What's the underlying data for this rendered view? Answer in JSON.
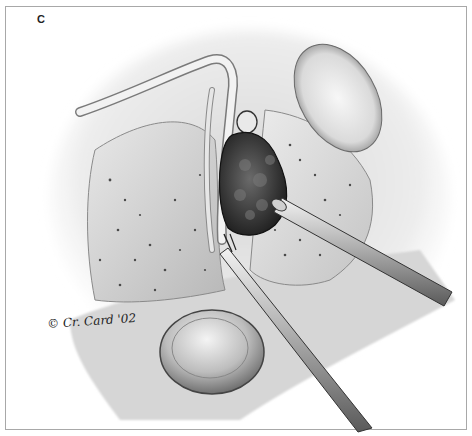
{
  "figure": {
    "panel_label": "C",
    "signature": "© Cr. Card '02"
  },
  "colors": {
    "frame_border": "#a8a8a8",
    "background": "#ffffff",
    "mass": "#3a3a3a",
    "instrument": "#9a9a9a"
  }
}
